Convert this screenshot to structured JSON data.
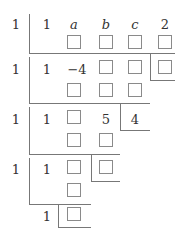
{
  "diagram": {
    "type": "synthetic-division",
    "top_clipped_text": "",
    "stage1": {
      "divisor": "1",
      "coefficients": [
        "1",
        "a",
        "b",
        "c",
        "2"
      ],
      "row2_blanks": 4
    },
    "stage2": {
      "divisor": "1",
      "coefficients": [
        "1",
        "-4",
        "□",
        "□"
      ],
      "remainder_blank": true,
      "row2_blanks": 3
    },
    "stage3": {
      "divisor": "1",
      "coefficients": [
        "1",
        "□",
        "5"
      ],
      "remainder": "4",
      "row2_blanks": 2
    },
    "stage4": {
      "divisor": "1",
      "coefficients": [
        "1",
        "□"
      ],
      "remainder_blank": true,
      "row2_blanks": 1
    },
    "stage5": {
      "coefficients": [
        "1"
      ],
      "remainder_blank": true
    },
    "labels": {
      "d1": "1",
      "c1_0": "1",
      "c1_1": "a",
      "c1_2": "b",
      "c1_3": "c",
      "c1_4": "2",
      "d2": "1",
      "c2_0": "1",
      "c2_1": "−4",
      "d3": "1",
      "c3_0": "1",
      "c3_2": "5",
      "r3": "4",
      "d4": "1",
      "c4_0": "1",
      "c5_0": "1"
    }
  }
}
